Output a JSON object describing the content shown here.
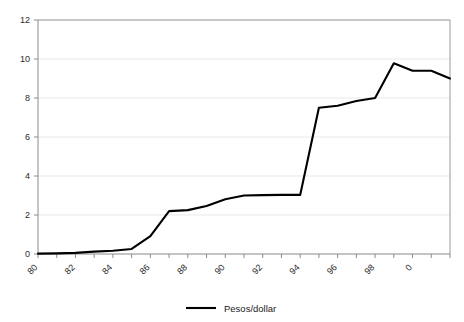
{
  "chart_data": {
    "type": "line",
    "title": "",
    "subtitle": "",
    "xlabel": "",
    "ylabel": "",
    "xlim": [
      1980,
      2002
    ],
    "ylim": [
      0,
      12
    ],
    "grid": true,
    "grid_axis": "y",
    "legend_position": "bottom-center",
    "x_tick_labels": [
      "80",
      "82",
      "84",
      "86",
      "88",
      "90",
      "92",
      "94",
      "96",
      "98",
      "0"
    ],
    "x_tick_values": [
      1980,
      1982,
      1984,
      1986,
      1988,
      1990,
      1992,
      1994,
      1996,
      1998,
      2000
    ],
    "x_tick_rotation_deg": -45,
    "y_tick_labels": [
      "0",
      "2",
      "4",
      "6",
      "8",
      "10",
      "12"
    ],
    "y_tick_values": [
      0,
      2,
      4,
      6,
      8,
      10,
      12
    ],
    "series": [
      {
        "name": "Pesos/dollar",
        "color": "#000000",
        "line_width": 2.1,
        "x": [
          1980,
          1981,
          1982,
          1983,
          1984,
          1985,
          1986,
          1987,
          1988,
          1989,
          1990,
          1991,
          1992,
          1993,
          1994,
          1995,
          1996,
          1997,
          1998,
          1999,
          2000,
          2001,
          2002
        ],
        "values": [
          0.02,
          0.03,
          0.06,
          0.12,
          0.17,
          0.26,
          0.92,
          2.2,
          2.25,
          2.46,
          2.81,
          3.0,
          3.02,
          3.03,
          3.03,
          7.5,
          7.6,
          7.85,
          8.0,
          9.78,
          9.4,
          9.4,
          9.0
        ]
      }
    ],
    "legend": [
      {
        "label": "Pesos/dollar",
        "color": "#000000",
        "marker": "line"
      }
    ]
  },
  "axes": {
    "frame_color": "#9a9a9a",
    "gridline_color": "#e9e9e9",
    "tick_color": "#8a8a8a",
    "background": "#ffffff"
  }
}
